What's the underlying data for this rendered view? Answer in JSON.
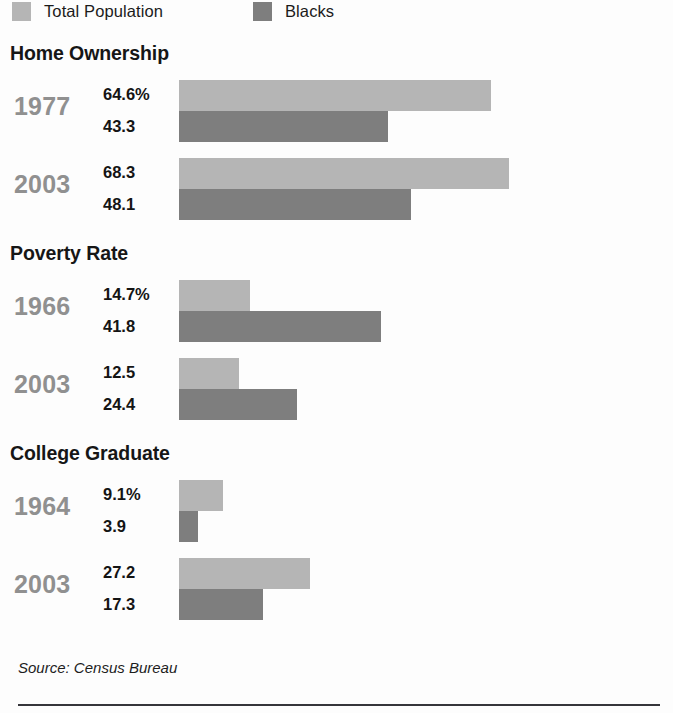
{
  "legend": {
    "items": [
      {
        "label": "Total Population",
        "swatch_color": "#b5b5b5",
        "icon": "legend-swatch-light"
      },
      {
        "label": "Blacks",
        "swatch_color": "#7e7e7e",
        "icon": "legend-swatch-dark"
      }
    ]
  },
  "footer": {
    "source": "Source: Census Bureau"
  },
  "colors": {
    "total_population": "#b5b5b5",
    "blacks": "#7e7e7e",
    "year_label": "#909090",
    "value_label": "#141414",
    "section_title": "#161616",
    "rule": "#35353a",
    "background": "#fdfdfd"
  },
  "sections": [
    {
      "title": "Home Ownership",
      "groups": [
        {
          "year": "1977",
          "total": {
            "label": "64.6%",
            "value": 64.6
          },
          "black": {
            "label": "43.3",
            "value": 43.3
          }
        },
        {
          "year": "2003",
          "total": {
            "label": "68.3",
            "value": 68.3
          },
          "black": {
            "label": "48.1",
            "value": 48.1
          }
        }
      ]
    },
    {
      "title": "Poverty Rate",
      "groups": [
        {
          "year": "1966",
          "total": {
            "label": "14.7%",
            "value": 14.7
          },
          "black": {
            "label": "41.8",
            "value": 41.8
          }
        },
        {
          "year": "2003",
          "total": {
            "label": "12.5",
            "value": 12.5
          },
          "black": {
            "label": "24.4",
            "value": 24.4
          }
        }
      ]
    },
    {
      "title": "College Graduate",
      "groups": [
        {
          "year": "1964",
          "total": {
            "label": "9.1%",
            "value": 9.1
          },
          "black": {
            "label": "3.9",
            "value": 3.9
          }
        },
        {
          "year": "2003",
          "total": {
            "label": "27.2",
            "value": 27.2
          },
          "black": {
            "label": "17.3",
            "value": 17.3
          }
        }
      ]
    }
  ],
  "chart_data": {
    "type": "bar",
    "orientation": "horizontal",
    "title": "",
    "subtitle": "",
    "xlabel": "",
    "ylabel": "",
    "grid": false,
    "legend_position": "top",
    "axis_visible": false,
    "units": "percent",
    "px_per_unit": 4.83,
    "bar_origin_px": 179,
    "series": [
      {
        "name": "Total Population",
        "color": "#b5b5b5",
        "values": [
          64.6,
          68.3,
          14.7,
          12.5,
          9.1,
          27.2
        ]
      },
      {
        "name": "Blacks",
        "color": "#7e7e7e",
        "values": [
          43.3,
          48.1,
          41.8,
          24.4,
          3.9,
          17.3
        ]
      }
    ],
    "categories": [
      "Home Ownership 1977",
      "Home Ownership 2003",
      "Poverty Rate 1966",
      "Poverty Rate 2003",
      "College Graduate 1964",
      "College Graduate 2003"
    ],
    "groups": [
      {
        "panel": "Home Ownership",
        "year": "1977",
        "Total Population": 64.6,
        "Blacks": 43.3
      },
      {
        "panel": "Home Ownership",
        "year": "2003",
        "Total Population": 68.3,
        "Blacks": 48.1
      },
      {
        "panel": "Poverty Rate",
        "year": "1966",
        "Total Population": 14.7,
        "Blacks": 41.8
      },
      {
        "panel": "Poverty Rate",
        "year": "2003",
        "Total Population": 12.5,
        "Blacks": 24.4
      },
      {
        "panel": "College Graduate",
        "year": "1964",
        "Total Population": 9.1,
        "Blacks": 3.9
      },
      {
        "panel": "College Graduate",
        "year": "2003",
        "Total Population": 27.2,
        "Blacks": 17.3
      }
    ],
    "source": "Source: Census Bureau"
  }
}
